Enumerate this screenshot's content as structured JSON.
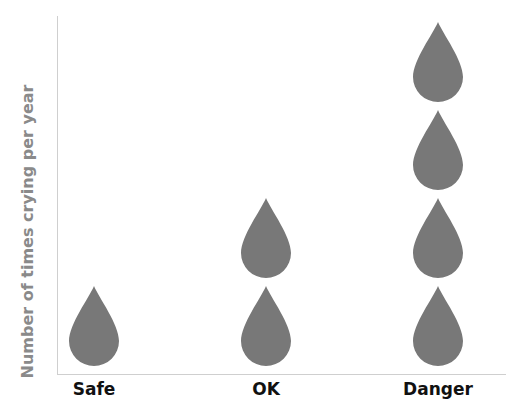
{
  "chart_data": {
    "type": "pictograph",
    "title": "",
    "xlabel": "",
    "ylabel": "Number of times crying per year",
    "categories": [
      "Safe",
      "OK",
      "Danger"
    ],
    "values": [
      1,
      2,
      4
    ],
    "icon": "water-drop-icon",
    "icon_color": "#787878",
    "grid": false,
    "legend": null
  },
  "axis": {
    "ylabel": "Number of times crying per year",
    "xlabels": [
      "Safe",
      "OK",
      "Danger"
    ]
  }
}
